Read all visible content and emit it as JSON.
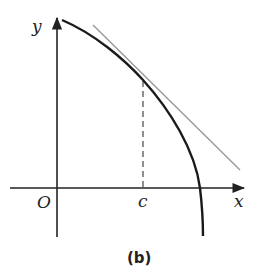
{
  "diagram": {
    "caption": "(b)",
    "labels": {
      "y_axis": "y",
      "x_axis": "x",
      "origin": "O",
      "point": "c"
    },
    "elements": {
      "curve": "concave-down decreasing curve starting near y-axis and crossing x-axis vertically",
      "tangent_line": "tangent line touching curve at x = c",
      "dashed_line": "vertical dashed line from x = c on x-axis up to point of tangency"
    },
    "colors": {
      "axes": "#222222",
      "curve": "#1a1a1a",
      "tangent": "#999999",
      "dashed": "#555555"
    }
  }
}
